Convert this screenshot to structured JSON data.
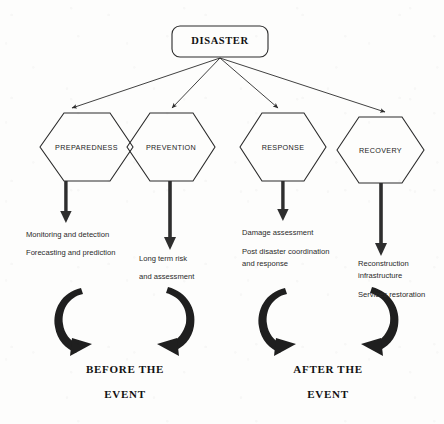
{
  "diagram": {
    "root": {
      "label": "DISASTER"
    },
    "phases": [
      {
        "name": "preparedness",
        "label": "PREPAREDNESS",
        "descriptions": [
          "Monitoring and detection",
          "Forecasting and prediction"
        ]
      },
      {
        "name": "prevention",
        "label": "PREVENTION",
        "descriptions": [
          "Long term risk",
          "and assessment"
        ]
      },
      {
        "name": "response",
        "label": "RESPONSE",
        "descriptions": [
          "Damage assessment",
          "Post disaster coordination",
          "and response"
        ]
      },
      {
        "name": "recovery",
        "label": "RECOVERY",
        "descriptions": [
          "Reconstruction",
          "infrastructure",
          "Services restoration"
        ]
      }
    ],
    "cycles": [
      {
        "name": "before",
        "line1": "BEFORE THE",
        "line2": "EVENT"
      },
      {
        "name": "after",
        "line1": "AFTER THE",
        "line2": "EVENT"
      }
    ],
    "colors": {
      "stroke": "#2b2b2b",
      "thick_arrow": "#2e2e2e",
      "background": "#fdfdfc",
      "text": "#1b1b1b"
    }
  }
}
